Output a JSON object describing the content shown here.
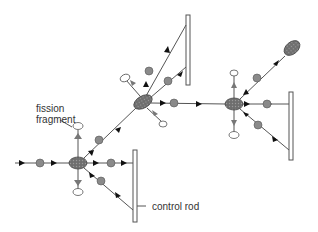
{
  "diagram": {
    "labels": {
      "fission_fragment": [
        "fission",
        "fragment"
      ],
      "control_rod": "control rod"
    },
    "colors": {
      "line": "#555555",
      "neutron": "#8a8a8a",
      "nucleus": "#7a7a7a",
      "rod": "#ffffff",
      "text": "#333333"
    }
  }
}
